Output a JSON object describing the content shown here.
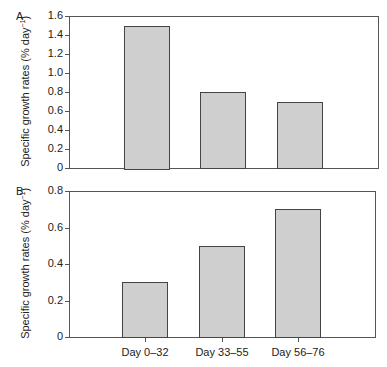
{
  "chart_data": [
    {
      "type": "bar",
      "panel": "A",
      "categories": [
        "Day 0–32",
        "Day 33–55",
        "Day 56–76"
      ],
      "values": [
        1.5,
        0.8,
        0.7
      ],
      "title": "",
      "xlabel": "",
      "ylabel": "Specific growth rates (% day−1)",
      "ylim": [
        0,
        1.6
      ],
      "yticks": [
        "0",
        "0.2",
        "0.4",
        "0.6",
        "0.8",
        "1.0",
        "1.2",
        "1.4",
        "1.6"
      ],
      "grid": false,
      "bar_color": "#cfcfcf"
    },
    {
      "type": "bar",
      "panel": "B",
      "categories": [
        "Day 0–32",
        "Day 33–55",
        "Day 56–76"
      ],
      "values": [
        0.3,
        0.5,
        0.7
      ],
      "title": "",
      "xlabel": "",
      "ylabel": "Specific growth rates (% day−1)",
      "ylim": [
        0,
        0.8
      ],
      "yticks": [
        "0",
        "0.2",
        "0.4",
        "0.6",
        "0.8"
      ],
      "grid": false,
      "bar_color": "#cfcfcf"
    }
  ],
  "panels": {
    "a": {
      "label": "A",
      "ylabel_main": "Specific growth rates (% day",
      "ylabel_sup": "−1",
      "ylabel_end": ")"
    },
    "b": {
      "label": "B",
      "ylabel_main": "Specific growth rates (% day",
      "ylabel_sup": "−1",
      "ylabel_end": ")"
    }
  },
  "x_categories": [
    "Day 0–32",
    "Day 33–55",
    "Day 56–76"
  ]
}
